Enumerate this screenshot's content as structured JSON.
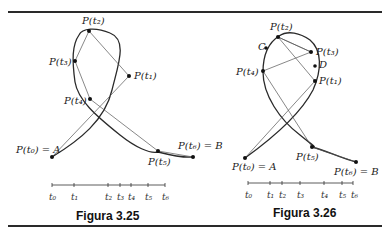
{
  "figures": [
    {
      "id": "3.25",
      "caption": "Figura 3.25",
      "points": {
        "p0": "P(t₀) = A",
        "p1": "P(t₁)",
        "p2": "P(t₂)",
        "p3": "P(t₃)",
        "p4": "P(t₄)",
        "p5": "P(t₅)",
        "p6": "P(t₆) = B"
      },
      "ticks": [
        "t₀",
        "t₁",
        "t₂",
        "t₃",
        "t₄",
        "t₅",
        "t₆"
      ]
    },
    {
      "id": "3.26",
      "caption": "Figura 3.26",
      "points": {
        "p0": "P(t₀) = A",
        "p1": "P(t₁)",
        "p2": "P(t₂)",
        "p3": "P(t₃)",
        "p4": "P(t₄)",
        "p5": "P(t₅)",
        "p6": "P(t₆) = B",
        "c": "C",
        "d": "D"
      },
      "ticks": [
        "t₀",
        "t₁",
        "t₂",
        "t₃",
        "t₄",
        "t₅",
        "t₆"
      ]
    }
  ],
  "colors": {
    "curve": "#2a2a2a",
    "chord": "#555555",
    "rule": "#2a2a2a"
  }
}
